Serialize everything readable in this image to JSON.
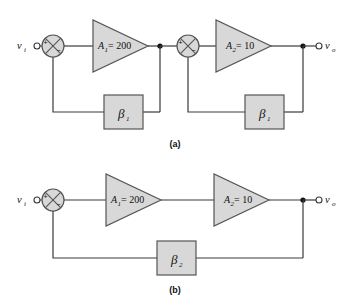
{
  "figure": {
    "background_color": "#ffffff",
    "line_color": "#3a3a3a",
    "shape_fill": "#d8d8d8",
    "shape_stroke": "#555555",
    "text_color": "#111111"
  },
  "diagram_a": {
    "caption": "(a)",
    "input_label": "v",
    "input_sub": "i",
    "output_label": "v",
    "output_sub": "o",
    "summing_junctions": [
      {
        "name": "summing-junction-a1",
        "plus": "+",
        "minus": "−"
      },
      {
        "name": "summing-junction-a2",
        "plus": "+",
        "minus": "−"
      }
    ],
    "amplifiers": [
      {
        "name": "amplifier-a1",
        "symbol": "A",
        "sub": "1",
        "eq": "= 200"
      },
      {
        "name": "amplifier-a2",
        "symbol": "A",
        "sub": "2",
        "eq": "= 10"
      }
    ],
    "feedback_blocks": [
      {
        "name": "feedback-block-beta1-stage1",
        "symbol": "β",
        "sub": "1"
      },
      {
        "name": "feedback-block-beta1-stage2",
        "symbol": "β",
        "sub": "1"
      }
    ]
  },
  "diagram_b": {
    "caption": "(b)",
    "input_label": "v",
    "input_sub": "i",
    "output_label": "v",
    "output_sub": "o",
    "summing_junctions": [
      {
        "name": "summing-junction-b1",
        "plus": "+",
        "minus": "−"
      }
    ],
    "amplifiers": [
      {
        "name": "amplifier-b1",
        "symbol": "A",
        "sub": "1",
        "eq": "= 200"
      },
      {
        "name": "amplifier-b2",
        "symbol": "A",
        "sub": "2",
        "eq": "= 10"
      }
    ],
    "feedback_blocks": [
      {
        "name": "feedback-block-beta2",
        "symbol": "β",
        "sub": "2"
      }
    ]
  }
}
